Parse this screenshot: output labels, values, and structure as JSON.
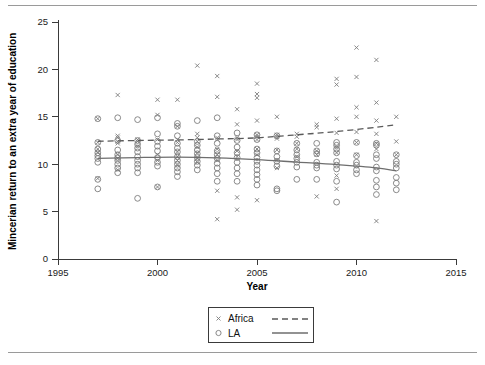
{
  "chart_data": {
    "type": "scatter",
    "title": "",
    "xlabel": "Year",
    "ylabel": "Mincerian return to an extra year of education",
    "xlim": [
      1995,
      2015
    ],
    "ylim": [
      0,
      25
    ],
    "xticks": [
      1995,
      2000,
      2005,
      2010,
      2015
    ],
    "yticks": [
      0,
      5,
      10,
      15,
      20,
      25
    ],
    "grid": false,
    "legend_position": "below-axes-center",
    "series": [
      {
        "name": "Africa",
        "marker": "x",
        "line_style": "dashed",
        "color": "#7d7d7d",
        "points": [
          [
            1997,
            14.8
          ],
          [
            1997,
            12.3
          ],
          [
            1997,
            11.6
          ],
          [
            1997,
            11.2
          ],
          [
            1997,
            8.5
          ],
          [
            1998,
            17.3
          ],
          [
            1998,
            13.0
          ],
          [
            1998,
            12.8
          ],
          [
            1998,
            12.4
          ],
          [
            1998,
            12.2
          ],
          [
            1998,
            11.0
          ],
          [
            1998,
            10.6
          ],
          [
            1998,
            9.4
          ],
          [
            1999,
            12.6
          ],
          [
            1999,
            12.4
          ],
          [
            1999,
            11.9
          ],
          [
            2000,
            16.8
          ],
          [
            2000,
            15.2
          ],
          [
            2000,
            12.6
          ],
          [
            2000,
            11.0
          ],
          [
            2000,
            10.4
          ],
          [
            2000,
            7.6
          ],
          [
            2001,
            16.8
          ],
          [
            2001,
            14.0
          ],
          [
            2001,
            12.6
          ],
          [
            2001,
            12.3
          ],
          [
            2001,
            11.3
          ],
          [
            2001,
            10.8
          ],
          [
            2001,
            10.4
          ],
          [
            2001,
            9.9
          ],
          [
            2002,
            20.4
          ],
          [
            2002,
            13.2
          ],
          [
            2002,
            12.8
          ],
          [
            2002,
            12.4
          ],
          [
            2002,
            11.8
          ],
          [
            2002,
            11.2
          ],
          [
            2002,
            10.6
          ],
          [
            2002,
            10.2
          ],
          [
            2003,
            19.3
          ],
          [
            2003,
            17.1
          ],
          [
            2003,
            12.8
          ],
          [
            2003,
            12.6
          ],
          [
            2003,
            11.6
          ],
          [
            2003,
            11.0
          ],
          [
            2003,
            10.4
          ],
          [
            2003,
            7.2
          ],
          [
            2003,
            4.2
          ],
          [
            2004,
            15.8
          ],
          [
            2004,
            14.2
          ],
          [
            2004,
            12.8
          ],
          [
            2004,
            12.6
          ],
          [
            2004,
            11.4
          ],
          [
            2004,
            10.8
          ],
          [
            2004,
            6.5
          ],
          [
            2004,
            5.2
          ],
          [
            2005,
            18.5
          ],
          [
            2005,
            17.4
          ],
          [
            2005,
            17.0
          ],
          [
            2005,
            14.6
          ],
          [
            2005,
            13.1
          ],
          [
            2005,
            12.9
          ],
          [
            2005,
            12.6
          ],
          [
            2005,
            11.6
          ],
          [
            2005,
            11.0
          ],
          [
            2005,
            6.2
          ],
          [
            2006,
            15.0
          ],
          [
            2006,
            13.1
          ],
          [
            2006,
            12.9
          ],
          [
            2006,
            12.7
          ],
          [
            2006,
            11.5
          ],
          [
            2006,
            10.4
          ],
          [
            2006,
            9.6
          ],
          [
            2007,
            13.2
          ],
          [
            2007,
            12.9
          ],
          [
            2007,
            12.2
          ],
          [
            2007,
            11.6
          ],
          [
            2007,
            10.8
          ],
          [
            2008,
            14.2
          ],
          [
            2008,
            13.9
          ],
          [
            2008,
            11.4
          ],
          [
            2008,
            11.0
          ],
          [
            2008,
            6.6
          ],
          [
            2009,
            19.0
          ],
          [
            2009,
            18.4
          ],
          [
            2009,
            14.8
          ],
          [
            2009,
            13.3
          ],
          [
            2009,
            11.8
          ],
          [
            2009,
            11.2
          ],
          [
            2009,
            8.8
          ],
          [
            2009,
            7.4
          ],
          [
            2010,
            22.3
          ],
          [
            2010,
            19.2
          ],
          [
            2010,
            16.0
          ],
          [
            2010,
            15.0
          ],
          [
            2010,
            13.4
          ],
          [
            2010,
            12.3
          ],
          [
            2010,
            11.0
          ],
          [
            2011,
            21.0
          ],
          [
            2011,
            16.5
          ],
          [
            2011,
            14.6
          ],
          [
            2011,
            13.2
          ],
          [
            2011,
            12.2
          ],
          [
            2011,
            11.6
          ],
          [
            2011,
            4.0
          ],
          [
            2012,
            15.0
          ],
          [
            2012,
            12.4
          ],
          [
            2012,
            11.0
          ]
        ],
        "fit_line": [
          [
            1997,
            12.42
          ],
          [
            1999,
            12.5
          ],
          [
            2001,
            12.56
          ],
          [
            2003,
            12.66
          ],
          [
            2005,
            12.78
          ],
          [
            2007,
            13.1
          ],
          [
            2009,
            13.45
          ],
          [
            2011,
            13.9
          ],
          [
            2012,
            14.18
          ]
        ]
      },
      {
        "name": "LA",
        "marker": "o",
        "line_style": "solid",
        "color": "#7d7d7d",
        "points": [
          [
            1997,
            14.8
          ],
          [
            1997,
            12.3
          ],
          [
            1997,
            11.6
          ],
          [
            1997,
            11.2
          ],
          [
            1997,
            10.9
          ],
          [
            1997,
            10.6
          ],
          [
            1997,
            10.2
          ],
          [
            1997,
            8.4
          ],
          [
            1997,
            7.4
          ],
          [
            1998,
            14.9
          ],
          [
            1998,
            12.5
          ],
          [
            1998,
            11.5
          ],
          [
            1998,
            11.0
          ],
          [
            1998,
            10.7
          ],
          [
            1998,
            10.4
          ],
          [
            1998,
            10.0
          ],
          [
            1998,
            9.6
          ],
          [
            1998,
            9.1
          ],
          [
            1999,
            14.7
          ],
          [
            1999,
            12.5
          ],
          [
            1999,
            12.1
          ],
          [
            1999,
            11.7
          ],
          [
            1999,
            11.3
          ],
          [
            1999,
            10.8
          ],
          [
            1999,
            10.4
          ],
          [
            1999,
            10.0
          ],
          [
            1999,
            9.6
          ],
          [
            1999,
            9.1
          ],
          [
            1999,
            6.4
          ],
          [
            2000,
            14.9
          ],
          [
            2000,
            13.2
          ],
          [
            2000,
            12.4
          ],
          [
            2000,
            11.9
          ],
          [
            2000,
            11.4
          ],
          [
            2000,
            10.7
          ],
          [
            2000,
            10.2
          ],
          [
            2000,
            9.8
          ],
          [
            2000,
            7.6
          ],
          [
            2001,
            14.3
          ],
          [
            2001,
            14.0
          ],
          [
            2001,
            13.0
          ],
          [
            2001,
            12.2
          ],
          [
            2001,
            11.7
          ],
          [
            2001,
            11.3
          ],
          [
            2001,
            10.8
          ],
          [
            2001,
            10.4
          ],
          [
            2001,
            10.0
          ],
          [
            2001,
            9.6
          ],
          [
            2001,
            9.2
          ],
          [
            2001,
            8.7
          ],
          [
            2002,
            14.6
          ],
          [
            2002,
            12.4
          ],
          [
            2002,
            12.0
          ],
          [
            2002,
            11.5
          ],
          [
            2002,
            11.1
          ],
          [
            2002,
            10.7
          ],
          [
            2002,
            10.3
          ],
          [
            2002,
            9.9
          ],
          [
            2002,
            9.4
          ],
          [
            2003,
            14.9
          ],
          [
            2003,
            13.0
          ],
          [
            2003,
            12.2
          ],
          [
            2003,
            11.4
          ],
          [
            2003,
            11.0
          ],
          [
            2003,
            10.6
          ],
          [
            2003,
            10.1
          ],
          [
            2003,
            9.6
          ],
          [
            2003,
            9.0
          ],
          [
            2003,
            8.2
          ],
          [
            2004,
            13.3
          ],
          [
            2004,
            12.5
          ],
          [
            2004,
            11.8
          ],
          [
            2004,
            11.2
          ],
          [
            2004,
            10.7
          ],
          [
            2004,
            10.2
          ],
          [
            2004,
            9.6
          ],
          [
            2004,
            9.0
          ],
          [
            2004,
            8.2
          ],
          [
            2005,
            13.1
          ],
          [
            2005,
            12.6
          ],
          [
            2005,
            11.6
          ],
          [
            2005,
            11.2
          ],
          [
            2005,
            10.7
          ],
          [
            2005,
            10.3
          ],
          [
            2005,
            9.9
          ],
          [
            2005,
            9.4
          ],
          [
            2005,
            8.9
          ],
          [
            2005,
            8.4
          ],
          [
            2005,
            7.8
          ],
          [
            2006,
            13.0
          ],
          [
            2006,
            11.4
          ],
          [
            2006,
            10.8
          ],
          [
            2006,
            10.3
          ],
          [
            2006,
            9.8
          ],
          [
            2006,
            7.4
          ],
          [
            2006,
            7.2
          ],
          [
            2007,
            12.2
          ],
          [
            2007,
            11.5
          ],
          [
            2007,
            11.0
          ],
          [
            2007,
            10.6
          ],
          [
            2007,
            10.2
          ],
          [
            2007,
            9.7
          ],
          [
            2007,
            8.4
          ],
          [
            2008,
            12.2
          ],
          [
            2008,
            11.4
          ],
          [
            2008,
            11.1
          ],
          [
            2008,
            10.2
          ],
          [
            2008,
            9.9
          ],
          [
            2008,
            9.6
          ],
          [
            2008,
            8.4
          ],
          [
            2009,
            12.3
          ],
          [
            2009,
            12.0
          ],
          [
            2009,
            11.6
          ],
          [
            2009,
            11.2
          ],
          [
            2009,
            10.3
          ],
          [
            2009,
            9.9
          ],
          [
            2009,
            9.5
          ],
          [
            2009,
            8.2
          ],
          [
            2009,
            6.0
          ],
          [
            2010,
            12.3
          ],
          [
            2010,
            10.9
          ],
          [
            2010,
            10.2
          ],
          [
            2010,
            9.9
          ],
          [
            2010,
            9.4
          ],
          [
            2010,
            9.0
          ],
          [
            2011,
            12.2
          ],
          [
            2011,
            12.0
          ],
          [
            2011,
            11.0
          ],
          [
            2011,
            10.6
          ],
          [
            2011,
            9.7
          ],
          [
            2011,
            9.3
          ],
          [
            2011,
            8.3
          ],
          [
            2011,
            7.6
          ],
          [
            2011,
            6.8
          ],
          [
            2012,
            11.0
          ],
          [
            2012,
            10.3
          ],
          [
            2012,
            10.0
          ],
          [
            2012,
            9.6
          ],
          [
            2012,
            8.6
          ],
          [
            2012,
            8.0
          ],
          [
            2012,
            7.3
          ]
        ],
        "fit_line": [
          [
            1997,
            10.62
          ],
          [
            1999,
            10.7
          ],
          [
            2001,
            10.74
          ],
          [
            2003,
            10.66
          ],
          [
            2005,
            10.48
          ],
          [
            2007,
            10.22
          ],
          [
            2009,
            9.96
          ],
          [
            2011,
            9.62
          ],
          [
            2012,
            9.3
          ]
        ]
      }
    ]
  },
  "axes": {
    "x_title": "Year",
    "y_title": "Mincerian return to an extra year of education",
    "x_tick_labels": [
      "1995",
      "2000",
      "2005",
      "2010",
      "2015"
    ],
    "y_tick_labels": [
      "0",
      "5",
      "10",
      "15",
      "20",
      "25"
    ]
  },
  "legend": {
    "entries": [
      {
        "label": "Africa",
        "marker": "x",
        "line": "dashed"
      },
      {
        "label": "LA",
        "marker": "o",
        "line": "solid"
      }
    ]
  },
  "colors": {
    "marker": "#7d7d7d",
    "axis": "#3a3a3a",
    "fit_africa": "#5a5a5a",
    "fit_la": "#6e6e6e",
    "rule": "#9a9a9a"
  }
}
